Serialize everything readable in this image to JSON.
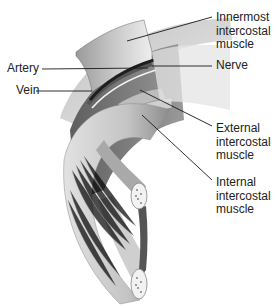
{
  "diagram": {
    "labels": {
      "innermost": "Innermost\nintercostal\nmuscle",
      "nerve": "Nerve",
      "artery": "Artery",
      "vein": "Vein",
      "external": "External\nintercostal\nmuscle",
      "internal": "Internal\nintercostal\nmuscle"
    },
    "colors": {
      "background": "#ffffff",
      "text": "#222222",
      "leader_line": "#1a1a1a",
      "muscle_light": "#d9d9d9",
      "muscle_mid": "#a8a8a8",
      "muscle_dark": "#6e6e6e",
      "vessel_dark": "#1e1e1e"
    }
  }
}
